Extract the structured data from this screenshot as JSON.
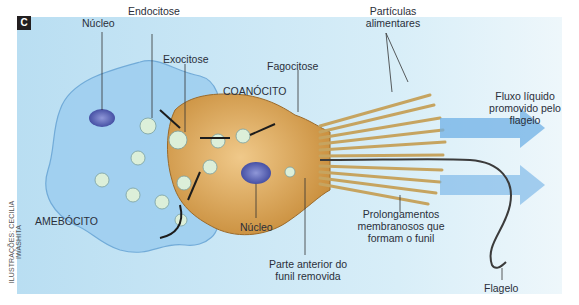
{
  "figure": {
    "panel_letter": "C",
    "credit": "ILUSTRAÇÕES: CECILIA IWASHITA",
    "colors": {
      "background": "#d6ecf7",
      "amebocyte": "#a8d3ef",
      "choanocyte": "#d9a85a",
      "nucleus": "#5a66b8",
      "flow_arrow": "#5fa6e0",
      "collar": "#e8d49a"
    }
  },
  "labels": {
    "nucleo_amebocito": "Núcleo",
    "endocitose": "Endocitose",
    "exocitose": "Exocitose",
    "coanocito": "COANÓCITO",
    "fagocitose": "Fagocitose",
    "particulas_line1": "Partículas",
    "particulas_line2": "alimentares",
    "fluxo_line1": "Fluxo líquido",
    "fluxo_line2": "promovido pelo",
    "fluxo_line3": "flagelo",
    "amebocito": "AMEBÓCITO",
    "nucleo_coanocito": "Núcleo",
    "prolong_line1": "Prolongamentos",
    "prolong_line2": "membranosos que",
    "prolong_line3": "formam o funil",
    "parte_line1": "Parte anterior do",
    "parte_line2": "funil removida",
    "flagelo": "Flagelo"
  }
}
